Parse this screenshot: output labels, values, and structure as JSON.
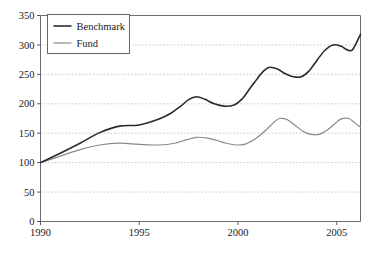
{
  "chart_data": {
    "type": "line",
    "title": "",
    "subtitle": "",
    "xlabel": "",
    "ylabel": "",
    "xlim": [
      1990,
      2006.2
    ],
    "ylim": [
      0,
      350
    ],
    "grid": true,
    "legend_position": "top-left",
    "x_ticks": [
      "1990",
      "1995",
      "2000",
      "2005"
    ],
    "x_tick_values": [
      1990,
      1995,
      2000,
      2005
    ],
    "y_ticks": [
      "0",
      "50",
      "100",
      "150",
      "200",
      "250",
      "300",
      "350"
    ],
    "y_tick_values": [
      0,
      50,
      100,
      150,
      200,
      250,
      300,
      350
    ],
    "x": [
      1990,
      1990.5,
      1991,
      1991.5,
      1992,
      1992.5,
      1993,
      1993.5,
      1994,
      1994.5,
      1995,
      1995.5,
      1996,
      1996.5,
      1997,
      1997.5,
      1998,
      1998.5,
      1999,
      1999.5,
      2000,
      2000.5,
      2001,
      2001.5,
      2002,
      2002.5,
      2003,
      2003.5,
      2004,
      2004.5,
      2005,
      2005.5,
      2006,
      2006.2
    ],
    "series": [
      {
        "name": "Benchmark",
        "color": "#2b2b2b",
        "width": 1.6,
        "values": [
          100,
          108,
          116,
          124,
          133,
          142,
          151,
          158,
          162,
          163,
          164,
          168,
          174,
          181,
          188,
          196,
          205,
          211,
          209,
          202,
          196,
          194,
          196,
          202,
          212,
          226,
          241,
          253,
          261,
          262,
          257,
          251,
          248,
          248
        ]
      },
      {
        "name": "Fund",
        "color": "#8a8a8a",
        "width": 1.2,
        "values": [
          100,
          106,
          112,
          118,
          124,
          129,
          133,
          136,
          137,
          137,
          136,
          137,
          139,
          142,
          145,
          149,
          152,
          153,
          151,
          148,
          145,
          143,
          142,
          142,
          143,
          146,
          150,
          154,
          157,
          158,
          157,
          154,
          152,
          152
        ]
      }
    ],
    "benchmark_points": [
      [
        1990,
        100
      ],
      [
        1991,
        116
      ],
      [
        1992,
        133
      ],
      [
        1993,
        151
      ],
      [
        1994,
        162
      ],
      [
        1995,
        164
      ],
      [
        1996,
        174
      ],
      [
        1996.6,
        184
      ],
      [
        1997.1,
        196
      ],
      [
        1997.5,
        207
      ],
      [
        1997.9,
        212
      ],
      [
        1998.3,
        208
      ],
      [
        1998.8,
        200
      ],
      [
        1999.3,
        196
      ],
      [
        1999.8,
        198
      ],
      [
        2000.2,
        208
      ],
      [
        2000.6,
        226
      ],
      [
        2001.0,
        244
      ],
      [
        2001.3,
        256
      ],
      [
        2001.6,
        262
      ],
      [
        2002.0,
        259
      ],
      [
        2002.4,
        251
      ],
      [
        2002.8,
        246
      ],
      [
        2003.2,
        246
      ],
      [
        2003.6,
        256
      ],
      [
        2004.0,
        274
      ],
      [
        2004.4,
        291
      ],
      [
        2004.8,
        300
      ],
      [
        2005.2,
        298
      ],
      [
        2005.5,
        292
      ],
      [
        2005.8,
        292
      ],
      [
        2006.2,
        318
      ]
    ],
    "fund_points": [
      [
        1990,
        100
      ],
      [
        1991,
        111
      ],
      [
        1992,
        122
      ],
      [
        1993,
        130
      ],
      [
        1994,
        133
      ],
      [
        1995,
        131
      ],
      [
        1996,
        130
      ],
      [
        1996.8,
        133
      ],
      [
        1997.4,
        139
      ],
      [
        1997.9,
        143
      ],
      [
        1998.4,
        142
      ],
      [
        1998.9,
        138
      ],
      [
        1999.4,
        133
      ],
      [
        1999.9,
        130
      ],
      [
        2000.4,
        132
      ],
      [
        2000.9,
        141
      ],
      [
        2001.4,
        155
      ],
      [
        2001.8,
        168
      ],
      [
        2002.1,
        175
      ],
      [
        2002.5,
        173
      ],
      [
        2002.9,
        163
      ],
      [
        2003.3,
        153
      ],
      [
        2003.7,
        148
      ],
      [
        2004.1,
        148
      ],
      [
        2004.5,
        155
      ],
      [
        2004.9,
        166
      ],
      [
        2005.2,
        174
      ],
      [
        2005.6,
        175
      ],
      [
        2005.9,
        168
      ],
      [
        2006.2,
        160
      ]
    ]
  },
  "legend": {
    "entries": [
      {
        "label": "Benchmark"
      },
      {
        "label": "Fund"
      }
    ]
  },
  "colors": {
    "benchmark": "#2b2b2b",
    "fund": "#8a8a8a",
    "grid": "#bdbdbd",
    "axis": "#6b6b6b",
    "text": "#1a1a1a",
    "background": "#ffffff"
  }
}
